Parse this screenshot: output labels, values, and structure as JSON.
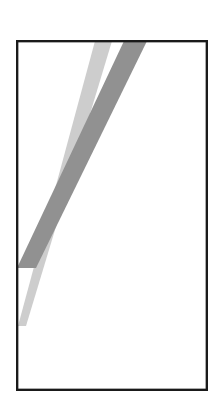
{
  "figure": {
    "width": 219,
    "height": 403,
    "background_color": "#ffffff",
    "frame": {
      "name": "rectangular-border",
      "x": 16,
      "y": 40,
      "width": 192,
      "height": 351,
      "stroke_color": "#1a1a1a",
      "stroke_width": 2.2,
      "fill_color": "#ffffff"
    },
    "bands": [
      {
        "name": "light-gray-band",
        "color": "#cdcdcd",
        "top_left_x": 95,
        "top_right_x": 112,
        "top_y": 41,
        "bottom_left_x": 18,
        "bottom_right_x": 26,
        "bottom_y": 326,
        "description": "light gray diagonal band from upper right to lower left, tapering near the bottom"
      },
      {
        "name": "medium-gray-band",
        "color": "#919191",
        "top_left_x": 124,
        "top_right_x": 147,
        "top_y": 41,
        "bottom_left_x": 17,
        "bottom_right_x": 36,
        "bottom_y": 268,
        "description": "medium gray diagonal band from upper right to lower left, exiting at the left border"
      }
    ],
    "crossing": {
      "name": "band-crossing-point",
      "x": 60,
      "y": 193,
      "description": "the two diagonal bands intersect forming a narrow scissor shape"
    }
  }
}
